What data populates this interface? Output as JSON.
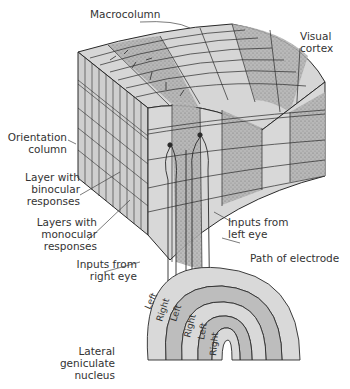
{
  "figure": {
    "type": "anatomical-diagram",
    "colors": {
      "light_gray": "#d9d9d9",
      "stipple_gray": "#a8a8a8",
      "line": "#2a2a2a",
      "text": "#333333"
    }
  },
  "labels": {
    "macrocolumn": "Macrocolumn",
    "visual_cortex": "Visual\ncortex",
    "orientation_column": "Orientation\ncolumn",
    "layer_binocular": "Layer with\nbinocular\nresponses",
    "layers_monocular": "Layers with\nmonocular\nresponses",
    "inputs_left_eye": "Inputs from\nleft eye",
    "inputs_right_eye": "Inputs from\nright eye",
    "path_electrode": "Path of electrode",
    "lgn": "Lateral\ngeniculate\nnucleus"
  },
  "lgn_layers": [
    "Left",
    "Right",
    "Left",
    "Right",
    "Left",
    "Right"
  ]
}
